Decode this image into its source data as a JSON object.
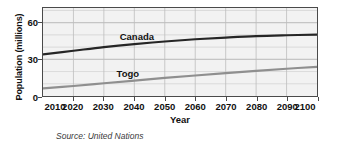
{
  "chart_data": {
    "type": "line",
    "title": "",
    "subtitle": "",
    "xlabel": "Year",
    "ylabel": "Population (millions)",
    "source_note": "Source: United Nations",
    "x": [
      2010,
      2020,
      2030,
      2040,
      2050,
      2060,
      2070,
      2080,
      2090,
      2100
    ],
    "xticklabels": [
      "2010",
      "2020",
      "2030",
      "2040",
      "2050",
      "2060",
      "2070",
      "2080",
      "2090",
      "2100"
    ],
    "xlim": [
      2010,
      2100
    ],
    "ylim": [
      0,
      72
    ],
    "yticks": [
      0,
      30,
      60
    ],
    "yticklabels": [
      "0",
      "30",
      "60"
    ],
    "minor_y_step": 10,
    "grid": "both",
    "legend_position": "inline-annotations",
    "plot_background": "#f2f2f2",
    "series": [
      {
        "name": "Canada",
        "color": "#262626",
        "label_x": 2035,
        "label_y": 53,
        "values": [
          34,
          37,
          40,
          42.5,
          44.6,
          46.4,
          47.8,
          49,
          49.7,
          50.2
        ]
      },
      {
        "name": "Togo",
        "color": "#8f8f8f",
        "label_x": 2034,
        "label_y": 23,
        "values": [
          6.2,
          8.2,
          10.4,
          12.6,
          14.8,
          16.8,
          18.7,
          20.6,
          22.3,
          23.8
        ]
      }
    ]
  }
}
